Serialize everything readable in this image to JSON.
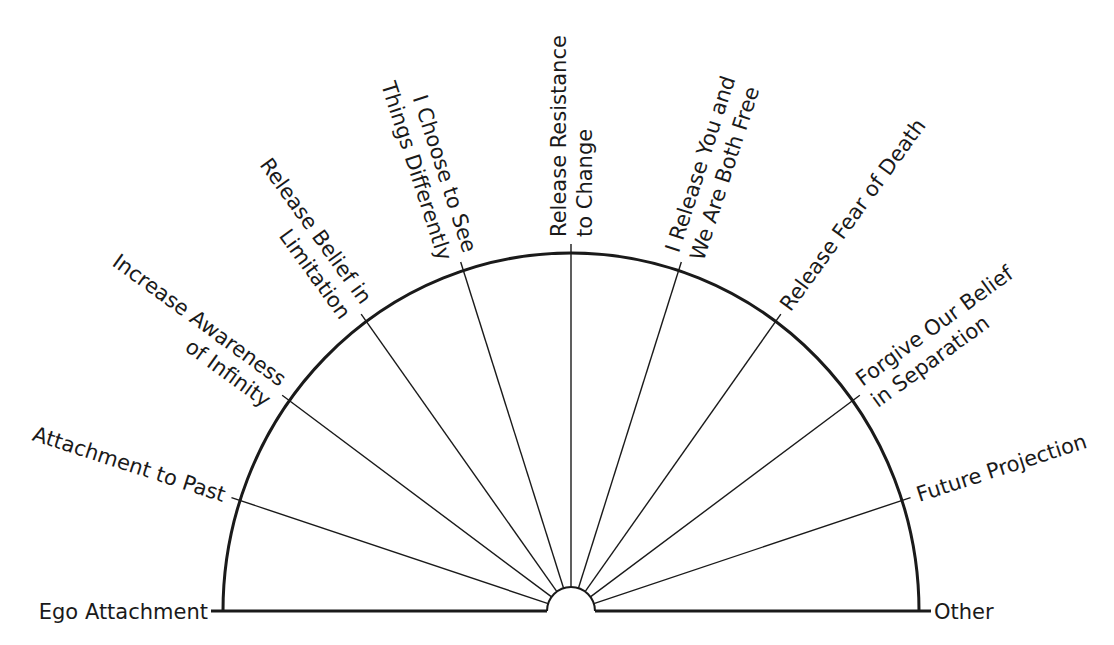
{
  "diagram": {
    "type": "semicircle-pendulum-chart",
    "center": {
      "x": 571,
      "y": 611
    },
    "radius_x": 348,
    "radius_y": 358,
    "inner_radius": 24,
    "colors": {
      "line": "#1a1a1a",
      "background": "#ffffff"
    },
    "baseline_labels": {
      "left": "Ego Attachment",
      "right": "Other"
    },
    "spokes": [
      {
        "angle_deg": 162,
        "lines": [
          "Attachment to Past"
        ]
      },
      {
        "angle_deg": 144,
        "lines": [
          "Increase Awareness",
          "of Infinity"
        ]
      },
      {
        "angle_deg": 126,
        "lines": [
          "Release Belief in",
          "Limitation"
        ]
      },
      {
        "angle_deg": 108,
        "lines": [
          "I Choose to See",
          "Things Differently"
        ]
      },
      {
        "angle_deg": 90,
        "lines": [
          "Release Resistance",
          "to Change"
        ]
      },
      {
        "angle_deg": 72,
        "lines": [
          "I Release You and",
          "We Are Both Free"
        ]
      },
      {
        "angle_deg": 54,
        "lines": [
          "Release Fear of Death"
        ]
      },
      {
        "angle_deg": 36,
        "lines": [
          "Forgive Our Belief",
          "in Separation"
        ]
      },
      {
        "angle_deg": 18,
        "lines": [
          "Future Projection"
        ]
      }
    ]
  }
}
